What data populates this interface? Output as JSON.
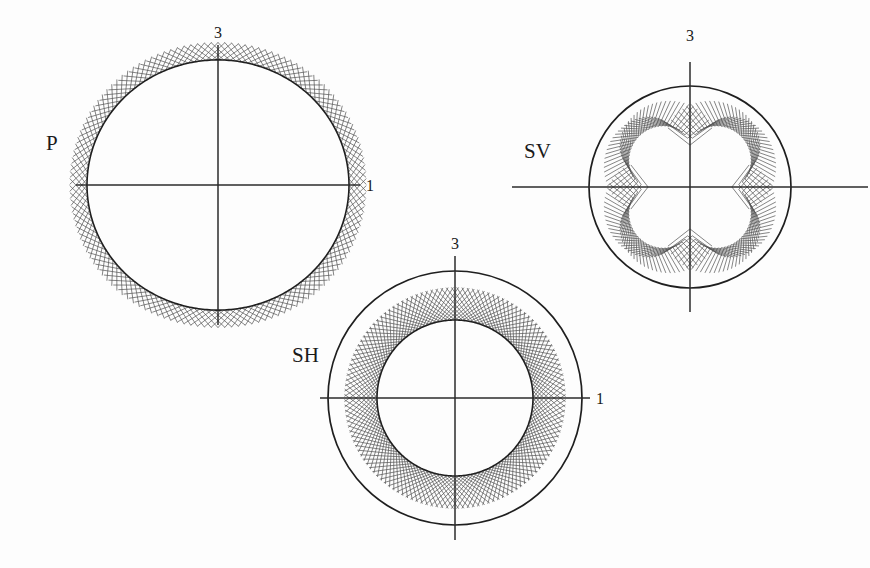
{
  "figure": {
    "background_color": "#fdfdfd",
    "ink_color": "#1f1f1f",
    "hatch_color": "#555555",
    "width": 870,
    "height": 568
  },
  "panels": [
    {
      "id": "p-wave",
      "label": "P",
      "label_x": 46,
      "label_y": 150,
      "center_x": 218,
      "center_y": 185,
      "axis_vertical_label": "3",
      "axis_vertical_label_x": 218,
      "axis_vertical_label_y": 38,
      "axis_horizontal_label": "1",
      "axis_horizontal_label_x": 366,
      "axis_horizontal_label_y": 191,
      "axis_half_width": 142,
      "axis_half_height": 140,
      "reference_radius": 0,
      "show_reference_circle": false,
      "show_data_curve": true,
      "curve_mean_radius": 131,
      "curve_shape": "ellipse-flattened",
      "curve_aniso": -0.045,
      "hatch_direction": "outward",
      "hatch_length": 26,
      "hatch_count": 132,
      "hatch_tilt_deg": 52
    },
    {
      "id": "sv-wave",
      "label": "SV",
      "label_x": 524,
      "label_y": 158,
      "center_x": 690,
      "center_y": 187,
      "axis_vertical_label": "3",
      "axis_vertical_label_x": 690,
      "axis_vertical_label_y": 41,
      "axis_horizontal_label": "",
      "axis_horizontal_label_x": 0,
      "axis_horizontal_label_y": 0,
      "axis_half_width": 178,
      "axis_half_height": 125,
      "reference_radius": 101,
      "show_reference_circle": true,
      "show_data_curve": false,
      "curve_mean_radius": 57,
      "curve_shape": "four-lobe-cushion",
      "curve_aniso": 0.3,
      "hatch_direction": "outward",
      "hatch_length": 28,
      "hatch_count": 132,
      "hatch_tilt_deg": 52
    },
    {
      "id": "sh-wave",
      "label": "SH",
      "label_x": 292,
      "label_y": 362,
      "center_x": 455,
      "center_y": 398,
      "axis_vertical_label": "3",
      "axis_vertical_label_x": 455,
      "axis_vertical_label_y": 249,
      "axis_horizontal_label": "1",
      "axis_horizontal_label_x": 596,
      "axis_horizontal_label_y": 404,
      "axis_half_width": 135,
      "axis_half_height": 142,
      "reference_radius": 127,
      "show_reference_circle": true,
      "show_data_curve": true,
      "curve_mean_radius": 78,
      "curve_shape": "circle",
      "curve_aniso": 0.0,
      "hatch_direction": "outward",
      "hatch_length": 44,
      "hatch_count": 132,
      "hatch_tilt_deg": 52
    }
  ],
  "chart_data": {
    "type": "line",
    "subtitle": "P, SV and SH phase-velocity surfaces in the 1-3 plane",
    "xlabel": "1",
    "ylabel": "3",
    "grid": false,
    "legend": "none",
    "coordinate_system": "polar",
    "angle_units": "degrees",
    "angle_reference": "0 deg along the 3 (vertical) axis, increasing clockwise",
    "axis_tick_labels": [
      "3",
      "1"
    ],
    "series": [
      {
        "name": "P",
        "description": "Quasi-compressional wave. Near-circular velocity surface, very weakly flattened along the 3 axis; hatching drawn outward from the curve.",
        "normalized_mean_radius": 1.0,
        "anisotropy_percent": -4.5,
        "angles_deg": [
          0,
          15,
          30,
          45,
          60,
          75,
          90,
          105,
          120,
          135,
          150,
          165,
          180,
          195,
          210,
          225,
          240,
          255,
          270,
          285,
          300,
          315,
          330,
          345
        ],
        "values": [
          0.957,
          0.96,
          0.969,
          0.98,
          0.991,
          0.998,
          1.0,
          0.998,
          0.991,
          0.98,
          0.969,
          0.96,
          0.957,
          0.96,
          0.969,
          0.98,
          0.991,
          0.998,
          1.0,
          0.998,
          0.991,
          0.98,
          0.969,
          0.96
        ]
      },
      {
        "name": "SV",
        "description": "Quasi-shear vertical wave. Strongly four-lobed cushion shape with sharp cusps on both the 1 and 3 axes and maxima near 45 degrees.",
        "normalized_mean_radius": 0.565,
        "anisotropy_percent": 30.0,
        "reference_circle_radius": 1.0,
        "angles_deg": [
          0,
          15,
          30,
          45,
          60,
          75,
          90,
          105,
          120,
          135,
          150,
          165,
          180,
          195,
          210,
          225,
          240,
          255,
          270,
          285,
          300,
          315,
          330,
          345
        ],
        "values": [
          0.415,
          0.47,
          0.608,
          0.712,
          0.608,
          0.47,
          0.415,
          0.47,
          0.608,
          0.712,
          0.608,
          0.47,
          0.415,
          0.47,
          0.608,
          0.712,
          0.608,
          0.47,
          0.415,
          0.47,
          0.608,
          0.712,
          0.608,
          0.47
        ]
      },
      {
        "name": "SH",
        "description": "Shear horizontal wave. Isotropic circular velocity surface inside the reference circle; hatching fills the annulus between them.",
        "normalized_mean_radius": 0.614,
        "anisotropy_percent": 0.0,
        "reference_circle_radius": 1.0,
        "angles_deg": [
          0,
          15,
          30,
          45,
          60,
          75,
          90,
          105,
          120,
          135,
          150,
          165,
          180,
          195,
          210,
          225,
          240,
          255,
          270,
          285,
          300,
          315,
          330,
          345
        ],
        "values": [
          0.614,
          0.614,
          0.614,
          0.614,
          0.614,
          0.614,
          0.614,
          0.614,
          0.614,
          0.614,
          0.614,
          0.614,
          0.614,
          0.614,
          0.614,
          0.614,
          0.614,
          0.614,
          0.614,
          0.614,
          0.614,
          0.614,
          0.614,
          0.614
        ]
      }
    ]
  }
}
